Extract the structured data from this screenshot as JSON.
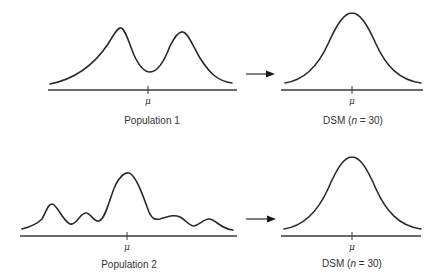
{
  "panels": [
    {
      "id": "population-1",
      "kind": "population",
      "shape": "bimodal",
      "label": "Population 1",
      "axis_marker": "μ"
    },
    {
      "id": "dsm-1",
      "kind": "sampling-distribution",
      "shape": "normal",
      "label_prefix": "DSM (",
      "label_n": "n",
      "label_suffix": " = 30)",
      "axis_marker": "μ"
    },
    {
      "id": "population-2",
      "kind": "population",
      "shape": "irregular-multimodal",
      "label": "Population 2",
      "axis_marker": "μ"
    },
    {
      "id": "dsm-2",
      "kind": "sampling-distribution",
      "shape": "normal",
      "label_prefix": "DSM (",
      "label_n": "n",
      "label_suffix": " = 30)",
      "axis_marker": "μ"
    }
  ],
  "arrows": [
    {
      "from": "population-1",
      "to": "dsm-1",
      "icon": "right-arrow-icon"
    },
    {
      "from": "population-2",
      "to": "dsm-2",
      "icon": "right-arrow-icon"
    }
  ],
  "colors": {
    "ink": "#2a2a2a",
    "background": "#ffffff"
  }
}
